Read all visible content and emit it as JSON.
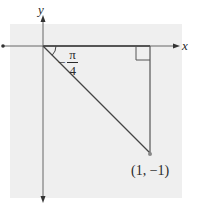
{
  "diagram": {
    "colors": {
      "background_panel": "#efefef",
      "axis": "#555555",
      "line": "#444444",
      "point": "#888888",
      "text": "#2a2a2a"
    },
    "axes": {
      "x_label": "x",
      "y_label": "y"
    },
    "angle": {
      "sign": "−",
      "numerator": "π",
      "denominator": "4",
      "value_text": "−π/4"
    },
    "point": {
      "label": "(1, −1)",
      "x": 1,
      "y": -1
    },
    "right_angle_marker": true
  }
}
